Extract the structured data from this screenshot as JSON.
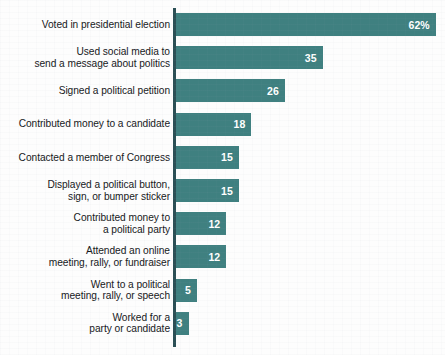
{
  "chart_data": {
    "type": "bar",
    "orientation": "horizontal",
    "title": "",
    "subtitle": "",
    "xlabel": "",
    "ylabel": "",
    "grid": false,
    "legend": null,
    "axis_line": "left",
    "xlim": [
      0,
      62
    ],
    "unit": "percent",
    "categories": [
      "Voted in presidential election",
      "Used social media to\nsend a message about politics",
      "Signed a political petition",
      "Contributed money to a candidate",
      "Contacted a member of Congress",
      "Displayed a political button,\nsign, or bumper sticker",
      "Contributed money to\na political party",
      "Attended an online\nmeeting, rally, or fundraiser",
      "Went to a political\nmeeting, rally, or speech",
      "Worked for a\nparty or candidate"
    ],
    "values": [
      62,
      35,
      26,
      18,
      15,
      15,
      12,
      12,
      5,
      3
    ],
    "value_labels": [
      "62%",
      "35",
      "26",
      "18",
      "15",
      "15",
      "12",
      "12",
      "5",
      "3"
    ],
    "colors": {
      "bar": "#3f8080",
      "axis": "#2b4f55",
      "label_text": "#16181b",
      "value_text": "#ffffff",
      "background": "#fdfdfd"
    }
  }
}
